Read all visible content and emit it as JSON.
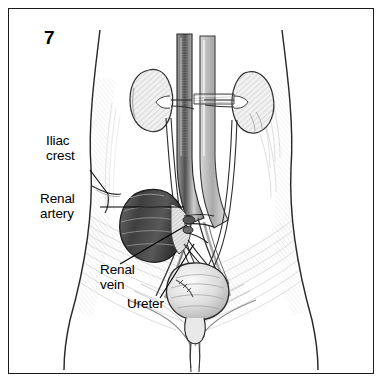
{
  "figure": {
    "number": "7",
    "border_color": "#1b1b1b",
    "background_color": "#ffffff",
    "ink_color": "#000000"
  },
  "labels": {
    "iliac_crest": "Iliac\ncrest",
    "renal_artery": "Renal\nartery",
    "renal_vein": "Renal\nvein",
    "ureter": "Ureter"
  },
  "anatomy": {
    "structures": [
      "torso-outline",
      "right-kidney",
      "left-kidney-displaced",
      "abdominal-aorta",
      "inferior-vena-cava",
      "renal-artery",
      "renal-vein",
      "ureter-left",
      "ureter-right",
      "urinary-bladder",
      "urethra",
      "iliac-crest",
      "common-iliac-vessels"
    ],
    "shading": {
      "light_hatch": "#cfcfcf",
      "mid_tone": "#8e8e8e",
      "dark_tone": "#3a3a3a",
      "outline": "#222222"
    }
  }
}
